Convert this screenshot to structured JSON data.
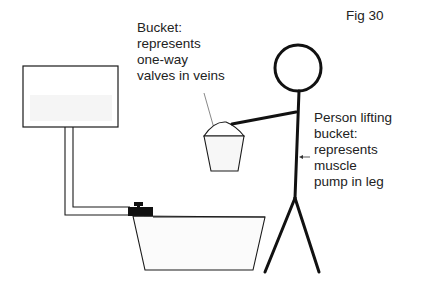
{
  "figure": {
    "label": "Fig 30"
  },
  "annotations": {
    "bucket": {
      "lines": [
        "Bucket:",
        "represents",
        "one-way",
        "valves in veins"
      ]
    },
    "person": {
      "lines": [
        "Person lifting",
        "bucket:",
        "represents",
        "muscle",
        "pump in leg"
      ]
    }
  },
  "elements": {
    "upper_tank": "tank",
    "pipe": "pipe",
    "tap": "tap-icon",
    "lower_basin": "basin",
    "bucket": "bucket",
    "stick_figure": "person"
  },
  "colors": {
    "stroke": "#1a1a1a",
    "fill_tint": "#f4f4f4",
    "background": "#ffffff"
  }
}
